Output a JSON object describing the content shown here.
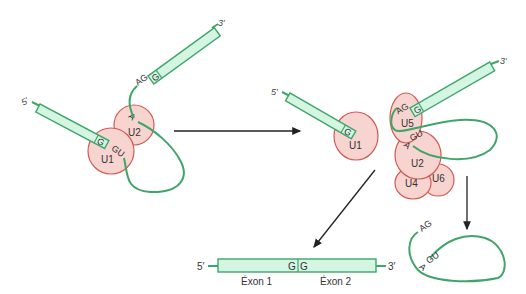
{
  "labels": {
    "five_prime": "5′",
    "three_prime": "3′",
    "G": "G",
    "GU": "GU",
    "AG": "AG",
    "A": "A",
    "U1": "U1",
    "U2": "U2",
    "U4": "U4",
    "U5": "U5",
    "U6": "U6",
    "exon1": "Éxon 1",
    "exon2": "Éxon 2"
  },
  "colors": {
    "rna": "#3fa56a",
    "exon_fill": "#d3f5e2",
    "snrnp_fill": "#f8d4d0",
    "snrnp_stroke": "#d25a55",
    "arrow": "#222222"
  },
  "stages": [
    {
      "name": "pre-mRNA with U1 and U2 bound",
      "snrnps": [
        "U1",
        "U2"
      ]
    },
    {
      "name": "5' exon with U1 released",
      "snrnps": [
        "U1"
      ]
    },
    {
      "name": "spliceosome assembly",
      "snrnps": [
        "U5",
        "U2",
        "U4",
        "U6"
      ]
    },
    {
      "name": "spliced exons",
      "exons": [
        "Éxon 1",
        "Éxon 2"
      ]
    },
    {
      "name": "excised lariat intron",
      "sites": [
        "AG",
        "GU",
        "A"
      ]
    }
  ]
}
